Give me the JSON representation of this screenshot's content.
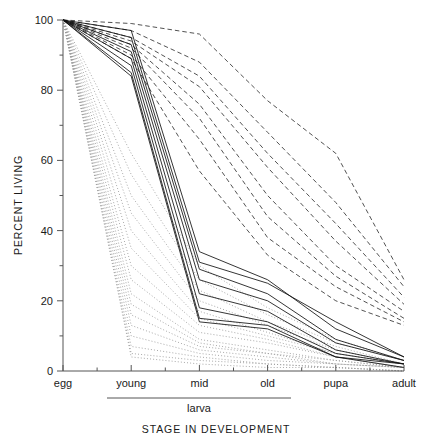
{
  "chart_data": {
    "type": "line",
    "title": "",
    "xlabel": "STAGE IN DEVELOPMENT",
    "ylabel": "PERCENT LIVING",
    "categories": [
      "egg",
      "young",
      "mid",
      "old",
      "pupa",
      "adult"
    ],
    "category_group": {
      "label": "larva",
      "members": [
        "young",
        "mid",
        "old"
      ]
    },
    "ylim": [
      0,
      100
    ],
    "yticks": [
      0,
      20,
      40,
      60,
      80,
      100
    ],
    "ytick_labels": [
      "0",
      "20",
      "40",
      "60",
      "80",
      "100"
    ],
    "yminor_interval": 10,
    "grid": false,
    "legend": "none",
    "xlim_categories": 6,
    "series": [
      {
        "name": "cohort-dashed-01",
        "style": "dashed",
        "values": [
          100,
          99,
          96,
          77,
          62,
          26
        ]
      },
      {
        "name": "cohort-dashed-02",
        "style": "dashed",
        "values": [
          100,
          97,
          88,
          68,
          48,
          24
        ]
      },
      {
        "name": "cohort-dashed-03",
        "style": "dashed",
        "values": [
          100,
          95,
          84,
          62,
          42,
          21
        ]
      },
      {
        "name": "cohort-dashed-04",
        "style": "dashed",
        "values": [
          100,
          94,
          81,
          58,
          37,
          19
        ]
      },
      {
        "name": "cohort-dashed-05",
        "style": "dashed",
        "values": [
          100,
          93,
          76,
          50,
          30,
          17
        ]
      },
      {
        "name": "cohort-dashed-06",
        "style": "dashed",
        "values": [
          100,
          92,
          72,
          44,
          27,
          15
        ]
      },
      {
        "name": "cohort-dashed-07",
        "style": "dashed",
        "values": [
          100,
          90,
          66,
          38,
          24,
          14
        ]
      },
      {
        "name": "cohort-dashed-08",
        "style": "dashed",
        "values": [
          100,
          89,
          57,
          33,
          20,
          13
        ]
      },
      {
        "name": "cohort-solid-01",
        "style": "solid",
        "values": [
          100,
          97,
          34,
          26,
          12,
          4
        ]
      },
      {
        "name": "cohort-solid-02",
        "style": "solid",
        "values": [
          100,
          95,
          31,
          25,
          14,
          4
        ]
      },
      {
        "name": "cohort-solid-03",
        "style": "solid",
        "values": [
          100,
          93,
          29,
          22,
          9,
          3
        ]
      },
      {
        "name": "cohort-solid-04",
        "style": "solid",
        "values": [
          100,
          91,
          26,
          20,
          8,
          3
        ]
      },
      {
        "name": "cohort-solid-05",
        "style": "solid",
        "values": [
          100,
          89,
          22,
          17,
          6,
          2
        ]
      },
      {
        "name": "cohort-solid-06",
        "style": "solid",
        "values": [
          100,
          87,
          18,
          14,
          5,
          2
        ]
      },
      {
        "name": "cohort-solid-07",
        "style": "solid",
        "values": [
          100,
          85,
          15,
          13,
          4,
          2
        ]
      },
      {
        "name": "cohort-solid-08",
        "style": "solid",
        "values": [
          100,
          84,
          14,
          12,
          4,
          1
        ]
      },
      {
        "name": "cohort-dotted-01",
        "style": "dotted",
        "values": [
          100,
          62,
          30,
          18,
          9,
          3
        ]
      },
      {
        "name": "cohort-dotted-02",
        "style": "dotted",
        "values": [
          100,
          56,
          26,
          16,
          8,
          3
        ]
      },
      {
        "name": "cohort-dotted-03",
        "style": "dotted",
        "values": [
          100,
          50,
          23,
          14,
          7,
          2
        ]
      },
      {
        "name": "cohort-dotted-04",
        "style": "dotted",
        "values": [
          100,
          45,
          20,
          13,
          6,
          2
        ]
      },
      {
        "name": "cohort-dotted-05",
        "style": "dotted",
        "values": [
          100,
          40,
          17,
          11,
          5,
          2
        ]
      },
      {
        "name": "cohort-dotted-06",
        "style": "dotted",
        "values": [
          100,
          35,
          15,
          10,
          5,
          2
        ]
      },
      {
        "name": "cohort-dotted-07",
        "style": "dotted",
        "values": [
          100,
          30,
          13,
          9,
          4,
          1
        ]
      },
      {
        "name": "cohort-dotted-08",
        "style": "dotted",
        "values": [
          100,
          26,
          11,
          8,
          4,
          1
        ]
      },
      {
        "name": "cohort-dotted-09",
        "style": "dotted",
        "values": [
          100,
          22,
          9,
          6,
          3,
          1
        ]
      },
      {
        "name": "cohort-dotted-10",
        "style": "dotted",
        "values": [
          100,
          19,
          8,
          5,
          3,
          1
        ]
      },
      {
        "name": "cohort-dotted-11",
        "style": "dotted",
        "values": [
          100,
          16,
          7,
          5,
          2,
          1
        ]
      },
      {
        "name": "cohort-dotted-12",
        "style": "dotted",
        "values": [
          100,
          13,
          6,
          4,
          2,
          1
        ]
      },
      {
        "name": "cohort-dotted-13",
        "style": "dotted",
        "values": [
          100,
          10,
          5,
          3,
          2,
          1
        ]
      },
      {
        "name": "cohort-dotted-14",
        "style": "dotted",
        "values": [
          100,
          7,
          4,
          2,
          1,
          0
        ]
      },
      {
        "name": "cohort-dotted-15",
        "style": "dotted",
        "values": [
          100,
          5,
          3,
          2,
          1,
          0
        ]
      },
      {
        "name": "cohort-dotted-16",
        "style": "dotted",
        "values": [
          100,
          4,
          2,
          1,
          1,
          0
        ]
      }
    ]
  },
  "colors": {
    "solid": "#111111",
    "dashed": "#333333",
    "dotted": "#9a9a9a",
    "axis": "#555555",
    "text": "#1a1a1a",
    "background": "#ffffff"
  }
}
